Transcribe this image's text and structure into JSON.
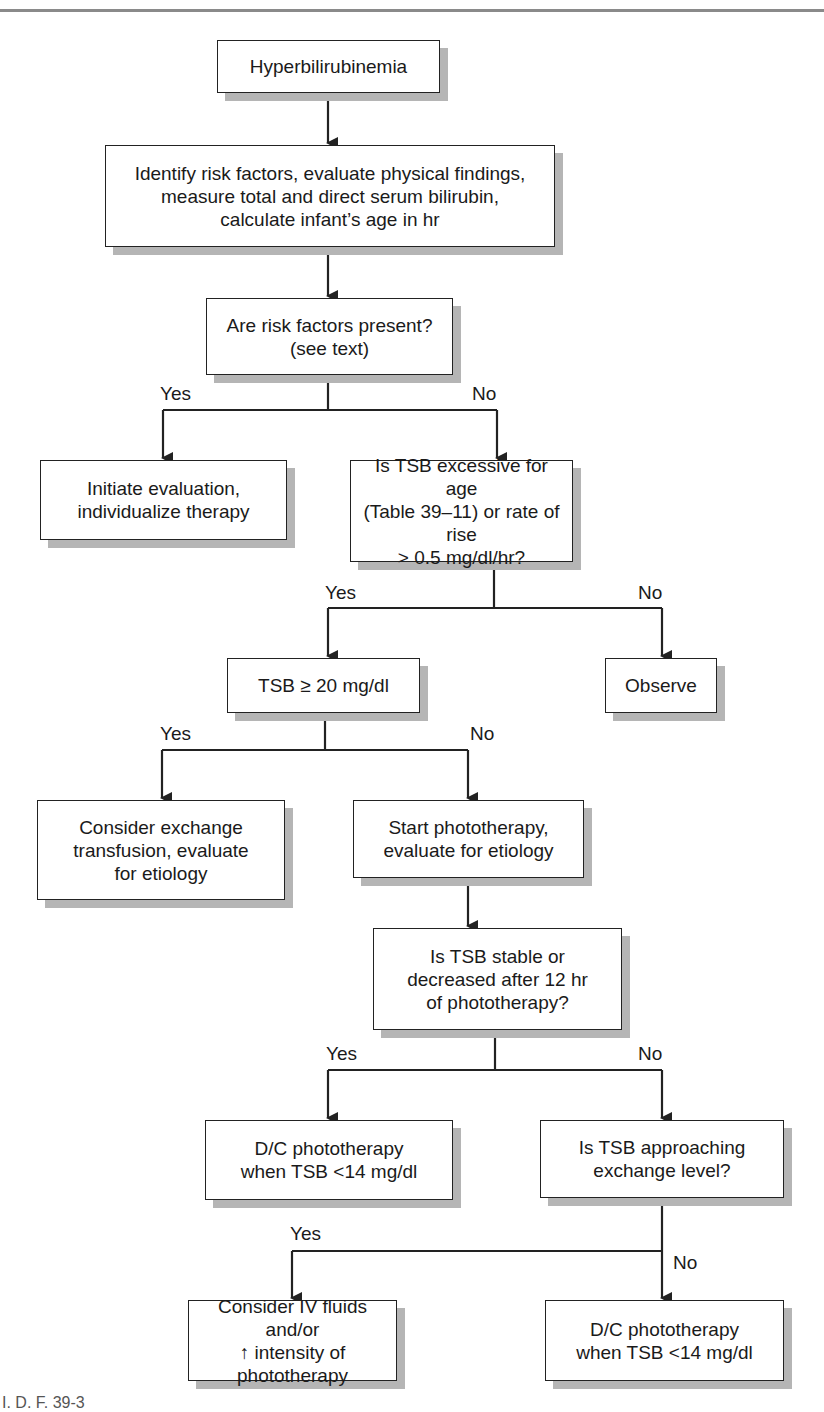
{
  "figure": {
    "footer_caption_fragment": "I. D. F.  39-3"
  },
  "nodes": {
    "start": "Hyperbilirubinemia",
    "identify": "Identify risk factors, evaluate physical findings,\nmeasure total and direct serum bilirubin,\ncalculate infant’s age in hr",
    "risk_factors": "Are risk factors present?\n(see text)",
    "initiate_eval": "Initiate evaluation,\nindividualize therapy",
    "tsb_excessive": "Is TSB excessive for age\n(Table 39–11) or rate of rise\n> 0.5 mg/dl/hr?",
    "tsb_ge_20": "TSB ≥ 20 mg/dl",
    "observe": "Observe",
    "exchange_transfusion": "Consider exchange\ntransfusion, evaluate\nfor etiology",
    "start_phototherapy": "Start phototherapy,\nevaluate for etiology",
    "tsb_stable": "Is TSB stable or\ndecreased after 12 hr\nof phototherapy?",
    "dc_phototherapy_1": "D/C phototherapy\nwhen TSB <14 mg/dl",
    "approaching_exchange": "Is TSB approaching\nexchange level?",
    "iv_fluids": "Consider IV fluids and/or\n↑ intensity of phototherapy",
    "dc_phototherapy_2": "D/C phototherapy\nwhen TSB <14 mg/dl"
  },
  "branch_labels": {
    "risk_yes": "Yes",
    "risk_no": "No",
    "excessive_yes": "Yes",
    "excessive_no": "No",
    "ge20_yes": "Yes",
    "ge20_no": "No",
    "stable_yes": "Yes",
    "stable_no": "No",
    "approach_yes": "Yes",
    "approach_no": "No"
  },
  "colors": {
    "line": "#222222",
    "shadow": "#b5b5b5",
    "box_fill": "#ffffff"
  }
}
